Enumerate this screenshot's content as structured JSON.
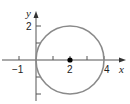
{
  "diagram": {
    "axes": {
      "x_label": "x",
      "y_label": "y",
      "x_tick_labels": [
        {
          "value": -1,
          "text": "−1"
        },
        {
          "value": 2,
          "text": "2"
        },
        {
          "value": 4,
          "text": "4"
        }
      ],
      "y_tick_labels": [
        {
          "value": 2,
          "text": "2"
        }
      ]
    },
    "circle": {
      "center": [
        2,
        0
      ],
      "radius": 2,
      "stroke": "#8a8a8a"
    },
    "center_point": {
      "x": 2,
      "y": 0,
      "color": "#000000"
    },
    "colors": {
      "axis": "#555555",
      "circle": "#8a8a8a",
      "text": "#222222"
    }
  }
}
